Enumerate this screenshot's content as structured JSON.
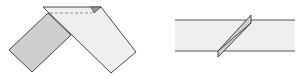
{
  "diagram": {
    "colors": {
      "background": "#ffffff",
      "strip_light": "#efefef",
      "strip_dark": "#cfcfcf",
      "crease": "#d8d8d8",
      "outline": "#333333",
      "dashed": "#888888"
    },
    "figures": [
      {
        "id": "left",
        "label": "folded-strip-inverted-v"
      },
      {
        "id": "right",
        "label": "straight-strip-diagonal-fold"
      }
    ]
  }
}
